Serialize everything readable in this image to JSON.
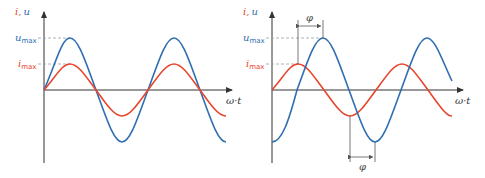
{
  "colors": {
    "voltage": "#2f6fb0",
    "current": "#e8452e",
    "axis": "#333333",
    "dash": "#9aa0a6",
    "annot": "#555555"
  },
  "left_diagram": {
    "title": "in-phase",
    "y_axis_label_i": "i",
    "y_axis_label_sep": ",",
    "y_axis_label_u": "u",
    "x_axis_label": "ω·t",
    "u_max_label": "u",
    "u_max_sub": "max",
    "i_max_label": "i",
    "i_max_sub": "max"
  },
  "right_diagram": {
    "title": "phase-shifted",
    "y_axis_label_i": "i",
    "y_axis_label_sep": ",",
    "y_axis_label_u": "u",
    "x_axis_label": "ω·t",
    "u_max_label": "u",
    "u_max_sub": "max",
    "i_max_label": "i",
    "i_max_sub": "max",
    "phase_label_top": "φ",
    "phase_label_bottom": "φ"
  }
}
